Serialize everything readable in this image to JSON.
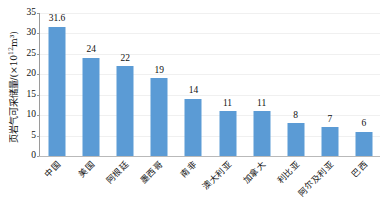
{
  "chart_data": {
    "type": "bar",
    "title": "",
    "xlabel": "",
    "ylabel": "页岩气可采储量/(×10¹²m³)",
    "ylabel_parts": {
      "prefix": "页岩气可采储量/(×10",
      "exponent": "12",
      "suffix": "m³)"
    },
    "ylim": [
      0,
      35
    ],
    "yticks": [
      0,
      5,
      10,
      15,
      20,
      25,
      30,
      35
    ],
    "ytick_labels": [
      "0",
      "5",
      "10",
      "15",
      "20",
      "25",
      "30",
      "35"
    ],
    "grid": true,
    "legend": false,
    "bar_color": "#5b9bd5",
    "axis_color": "#9a9a9a",
    "gridline_color": "#f0f0f0",
    "categories": [
      "中国",
      "美国",
      "阿根廷",
      "墨西哥",
      "南非",
      "澳大利亚",
      "加拿大",
      "利比亚",
      "阿尔及利亚",
      "巴西"
    ],
    "values": [
      31.6,
      24,
      22,
      19,
      14,
      11,
      11,
      8,
      7,
      6
    ],
    "value_labels": [
      "31.6",
      "24",
      "22",
      "19",
      "14",
      "11",
      "11",
      "8",
      "7",
      "6"
    ]
  }
}
